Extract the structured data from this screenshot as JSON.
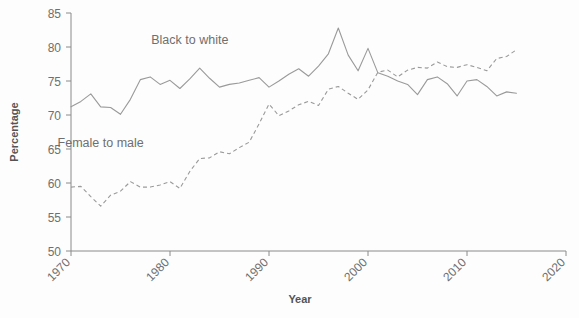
{
  "chart_data": {
    "type": "line",
    "title": "",
    "xlabel": "Year",
    "ylabel": "Percentage",
    "xlim": [
      1970,
      2020
    ],
    "ylim": [
      50,
      85
    ],
    "xticks": [
      1970,
      1980,
      1990,
      2000,
      2010,
      2020
    ],
    "yticks": [
      50,
      55,
      60,
      65,
      70,
      75,
      80,
      85
    ],
    "grid": false,
    "legend_position": "inline-annotation",
    "series": [
      {
        "name": "Black to white",
        "style": "solid",
        "color": "#9a9a9a",
        "label_x": 1982,
        "label_y": 80.5,
        "x": [
          1970,
          1971,
          1972,
          1973,
          1974,
          1975,
          1976,
          1977,
          1978,
          1979,
          1980,
          1981,
          1982,
          1983,
          1984,
          1985,
          1986,
          1987,
          1988,
          1989,
          1990,
          1991,
          1992,
          1993,
          1994,
          1995,
          1996,
          1997,
          1998,
          1999,
          2000,
          2001,
          2002,
          2003,
          2004,
          2005,
          2006,
          2007,
          2008,
          2009,
          2010,
          2011,
          2012,
          2013,
          2014,
          2015
        ],
        "values": [
          71.2,
          72.0,
          73.1,
          71.2,
          71.1,
          70.1,
          72.3,
          75.2,
          75.6,
          74.5,
          75.1,
          73.9,
          75.3,
          76.9,
          75.4,
          74.1,
          74.5,
          74.7,
          75.1,
          75.5,
          74.1,
          75.0,
          76.0,
          76.8,
          75.7,
          77.2,
          79.0,
          82.8,
          78.8,
          76.5,
          79.8,
          76.2,
          75.7,
          75.0,
          74.5,
          73.0,
          75.2,
          75.6,
          74.6,
          72.8,
          75.0,
          75.2,
          74.2,
          72.8,
          73.4,
          73.2
        ]
      },
      {
        "name": "Female to male",
        "style": "dashed",
        "color": "#9a9a9a",
        "label_x": 1973,
        "label_y": 65.3,
        "x": [
          1970,
          1971,
          1972,
          1973,
          1974,
          1975,
          1976,
          1977,
          1978,
          1979,
          1980,
          1981,
          1982,
          1983,
          1984,
          1985,
          1986,
          1987,
          1988,
          1989,
          1990,
          1991,
          1992,
          1993,
          1994,
          1995,
          1996,
          1997,
          1998,
          1999,
          2000,
          2001,
          2002,
          2003,
          2004,
          2005,
          2006,
          2007,
          2008,
          2009,
          2010,
          2011,
          2012,
          2013,
          2014,
          2015
        ],
        "values": [
          59.4,
          59.5,
          58.0,
          56.6,
          58.2,
          58.8,
          60.2,
          59.4,
          59.4,
          59.7,
          60.2,
          59.2,
          61.7,
          63.6,
          63.7,
          64.6,
          64.3,
          65.2,
          66.0,
          68.7,
          71.6,
          69.9,
          70.6,
          71.5,
          72.0,
          71.4,
          73.8,
          74.2,
          73.2,
          72.3,
          73.7,
          76.3,
          76.6,
          75.6,
          76.6,
          77.0,
          76.9,
          77.8,
          77.1,
          77.0,
          77.4,
          77.0,
          76.5,
          78.3,
          78.6,
          79.6
        ]
      }
    ]
  },
  "axes": {
    "y_label": "Percentage",
    "x_label": "Year",
    "y_tick_labels": [
      "85",
      "80",
      "75",
      "70",
      "65",
      "60",
      "55",
      "50"
    ],
    "x_tick_labels": [
      "1970",
      "1980",
      "1990",
      "2000",
      "2010",
      "2020"
    ]
  },
  "annotations": {
    "solid_label": "Black to white",
    "dashed_label": "Female to male"
  },
  "colors": {
    "line": "#9a9a9a",
    "axis": "#8a8a8a",
    "tick_text": "#6f6f6f",
    "title_text": "#545454",
    "background": "#fdfdfd"
  }
}
